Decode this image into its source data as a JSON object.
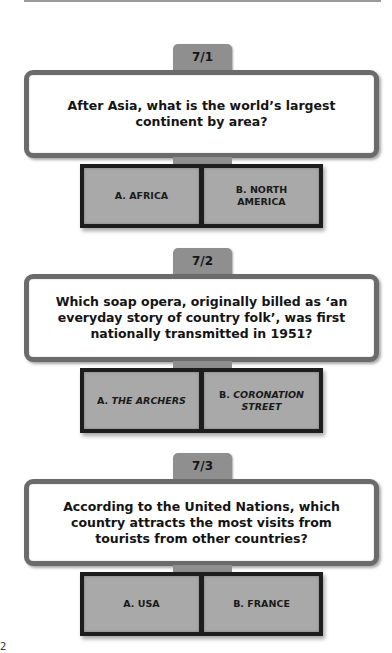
{
  "page": {
    "page_number": "2"
  },
  "questions": [
    {
      "number": "7/1",
      "text": "After Asia, what is the world’s largest continent by area?",
      "answers": [
        {
          "prefix": "A.",
          "label": "AFRICA",
          "italic": false
        },
        {
          "prefix": "B.",
          "label": "NORTH AMERICA",
          "italic": false
        }
      ]
    },
    {
      "number": "7/2",
      "text": "Which soap opera, originally billed as ‘an everyday story of country folk’, was first nationally transmitted in 1951?",
      "answers": [
        {
          "prefix": "A.",
          "label": "THE ARCHERS",
          "italic": true
        },
        {
          "prefix": "B.",
          "label": "CORONATION STREET",
          "italic": true
        }
      ]
    },
    {
      "number": "7/3",
      "text": "According to the United Nations, which country attracts the most visits from tourists from other countries?",
      "answers": [
        {
          "prefix": "A.",
          "label": "USA",
          "italic": false
        },
        {
          "prefix": "B.",
          "label": "FRANCE",
          "italic": false
        }
      ]
    }
  ],
  "colors": {
    "tab": "#8f8f8f",
    "question_border": "#6b6b6b",
    "answer_fill": "#a9a9a9",
    "answer_frame": "#1d1d1d"
  }
}
